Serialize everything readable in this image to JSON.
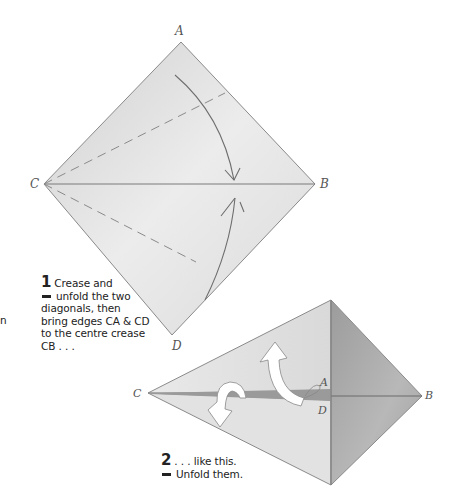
{
  "diagram1": {
    "labels": {
      "A": "A",
      "B": "B",
      "C": "C",
      "D": "D"
    },
    "colors": {
      "paper_light": "#eaeaea",
      "paper_mid": "#d6d6d6",
      "edge": "#8a8a8a",
      "crease": "#7a7a7a"
    }
  },
  "step1": {
    "number": "1",
    "lines": [
      "Crease and",
      "unfold the two",
      "diagonals, then",
      "bring edges CA & CD",
      "to the centre crease",
      "CB . . ."
    ]
  },
  "stray_text": "n",
  "diagram2": {
    "labels": {
      "A": "A",
      "B": "B",
      "C": "C",
      "D": "D"
    },
    "colors": {
      "paper_light": "#e4e4e4",
      "paper_dark": "#a9a9a9",
      "crease_band": "#8e8e8e",
      "arrow_fill": "#ffffff"
    }
  },
  "step2": {
    "number": "2",
    "lines": [
      ". . . like this.",
      "Unfold them."
    ]
  }
}
